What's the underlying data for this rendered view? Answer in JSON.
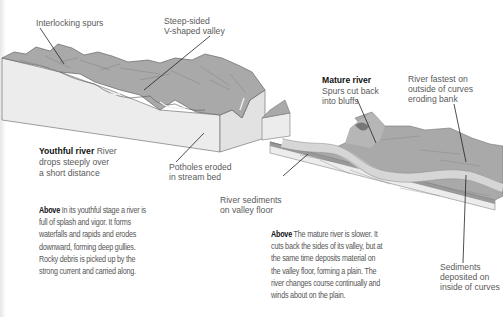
{
  "youthful": {
    "labels": {
      "interlocking_spurs": "Interlocking spurs",
      "steep_valley_1": "Steep-sided",
      "steep_valley_2": "V-shaped valley",
      "title": "Youthful river",
      "desc_1": "River",
      "desc_2": "drops steeply over",
      "desc_3": "a short distance",
      "potholes_1": "Potholes eroded",
      "potholes_2": "in stream bed"
    },
    "caption": {
      "lead": "Above",
      "lines": [
        "In its youthful stage a river is",
        "full of splash and vigor. It forms",
        "waterfalls and rapids and erodes",
        "downward, forming deep gullies.",
        "Rocky debris is picked up by the",
        "strong current and carried along."
      ]
    }
  },
  "mature": {
    "labels": {
      "title": "Mature river",
      "spurs_1": "Spurs cut back",
      "spurs_2": "into bluffs",
      "fastest_1": "River fastest on",
      "fastest_2": "outside of curves",
      "fastest_3": "eroding bank",
      "sediments_floor_1": "River sediments",
      "sediments_floor_2": "on valley floor",
      "deposited_1": "Sediments",
      "deposited_2": "deposited on",
      "deposited_3": "inside of curves"
    },
    "caption": {
      "lead": "Above",
      "lines": [
        "The mature river is slower. It",
        "cuts back the sides of its valley, but at",
        "the same time deposits material on",
        "the valley floor, forming a plain. The",
        "river changes course continually and",
        "winds about on the plain."
      ]
    }
  },
  "colors": {
    "terrain": "#a9a9a9",
    "block_side": "#ececec",
    "river": "#d6d6d6",
    "leader": "#222222"
  }
}
